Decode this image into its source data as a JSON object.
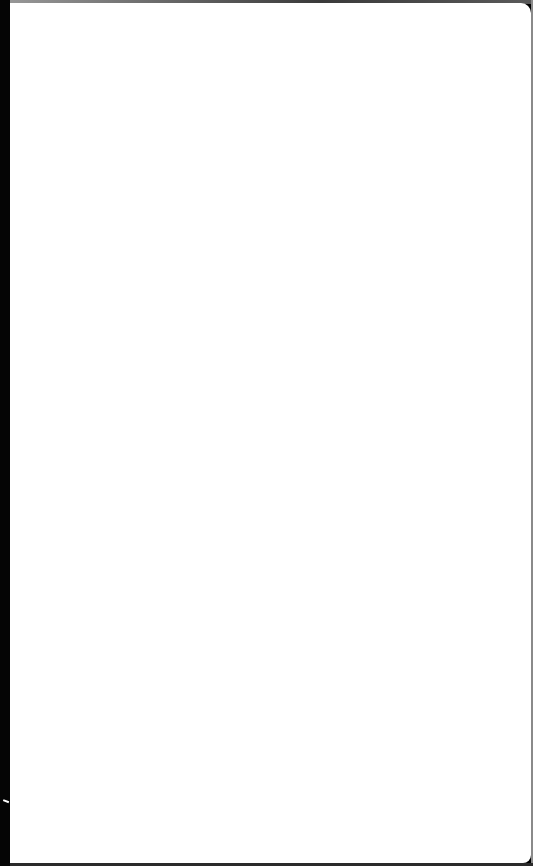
{
  "screen": {
    "state": "blank",
    "background_color": "#ffffff",
    "bezel_color": "#050505",
    "visible_text": ""
  }
}
